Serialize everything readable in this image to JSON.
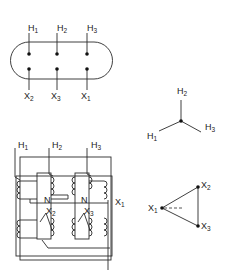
{
  "diagram": {
    "terminal_board": {
      "high_side": [
        {
          "letter": "H",
          "index": "1"
        },
        {
          "letter": "H",
          "index": "2"
        },
        {
          "letter": "H",
          "index": "3"
        }
      ],
      "low_side": [
        {
          "letter": "X",
          "index": "2"
        },
        {
          "letter": "X",
          "index": "3"
        },
        {
          "letter": "X",
          "index": "1"
        }
      ]
    },
    "wye_vector": {
      "top": {
        "letter": "H",
        "index": "2"
      },
      "left": {
        "letter": "H",
        "index": "1"
      },
      "right": {
        "letter": "H",
        "index": "3"
      }
    },
    "delta_vector": {
      "left": {
        "letter": "X",
        "index": "1"
      },
      "top": {
        "letter": "X",
        "index": "2"
      },
      "bottom": {
        "letter": "X",
        "index": "3"
      }
    },
    "winding_diagram": {
      "high_terminals": [
        {
          "letter": "H",
          "index": "1"
        },
        {
          "letter": "H",
          "index": "2"
        },
        {
          "letter": "H",
          "index": "3"
        }
      ],
      "neutral_labels": [
        "N",
        "N"
      ],
      "low_terminals": [
        {
          "letter": "X",
          "index": "2"
        },
        {
          "letter": "X",
          "index": "3"
        },
        {
          "letter": "X",
          "index": "1"
        }
      ]
    },
    "colors": {
      "line": "#2a2a2a",
      "background": "#ffffff"
    }
  }
}
